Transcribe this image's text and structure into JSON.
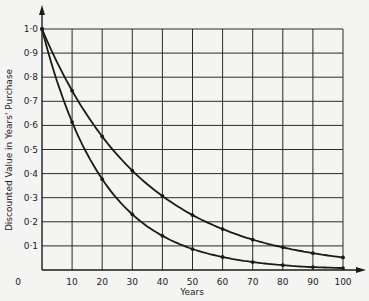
{
  "chart_data": {
    "type": "line",
    "title": "",
    "xlabel": "Years",
    "ylabel": "Discounted Value in Years' Purchase",
    "xlim": [
      0,
      100
    ],
    "ylim": [
      0,
      1.0
    ],
    "grid": true,
    "legend": null,
    "x": [
      0,
      10,
      20,
      30,
      40,
      50,
      60,
      70,
      80,
      90,
      100
    ],
    "x_ticks": [
      "0",
      "10",
      "20",
      "30",
      "40",
      "50",
      "60",
      "70",
      "80",
      "90",
      "100"
    ],
    "y_ticks": [
      "0·1",
      "0·2",
      "0·3",
      "0·4",
      "0·5",
      "0·6",
      "0·7",
      "0·8",
      "0·9",
      "1·0"
    ],
    "series": [
      {
        "name": "upper curve",
        "values": [
          1.0,
          0.744,
          0.554,
          0.412,
          0.307,
          0.228,
          0.17,
          0.126,
          0.094,
          0.07,
          0.052
        ]
      },
      {
        "name": "lower curve",
        "values": [
          1.0,
          0.614,
          0.377,
          0.231,
          0.142,
          0.087,
          0.054,
          0.033,
          0.02,
          0.012,
          0.008
        ]
      }
    ]
  },
  "colors": {
    "line": "#1a1a1a",
    "grid": "#2a2a2a",
    "background": "#f4f4f2"
  }
}
